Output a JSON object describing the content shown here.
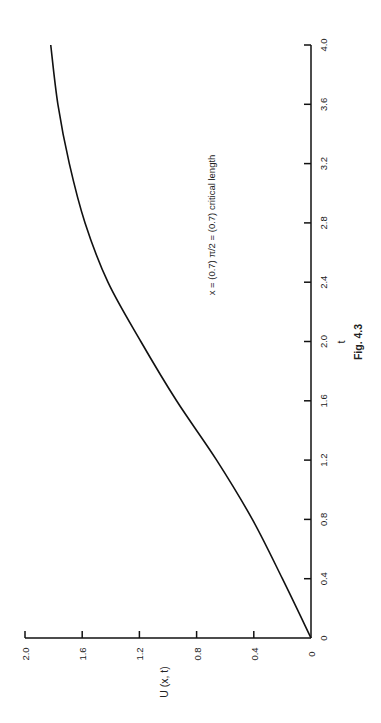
{
  "chart_data": {
    "type": "line",
    "orientation": "rotated 90 degrees counter-clockwise (t axis runs vertically along right edge, U axis horizontally along bottom)",
    "title": "",
    "caption": "Fig. 4.3",
    "xlabel": "t",
    "ylabel": "U (x, t)",
    "annotation": "x = (0.7) π/2 = (0.7) critical length",
    "xlim": [
      0,
      4.0
    ],
    "ylim": [
      0,
      2.0
    ],
    "x_ticks": [
      "0",
      "0.4",
      "0.8",
      "1.2",
      "1.6",
      "2.0",
      "2.4",
      "2.8",
      "3.2",
      "3.6",
      "4.0"
    ],
    "y_ticks": [
      "0",
      "0.4",
      "0.8",
      "1.2",
      "1.6",
      "2.0"
    ],
    "grid": false,
    "legend": null,
    "series": [
      {
        "name": "U(x,t)",
        "x": [
          0,
          0.4,
          0.8,
          1.2,
          1.6,
          2.0,
          2.4,
          2.8,
          3.2,
          3.6,
          4.0
        ],
        "values": [
          0,
          0.2,
          0.41,
          0.66,
          0.94,
          1.19,
          1.42,
          1.58,
          1.69,
          1.77,
          1.82
        ]
      }
    ]
  }
}
